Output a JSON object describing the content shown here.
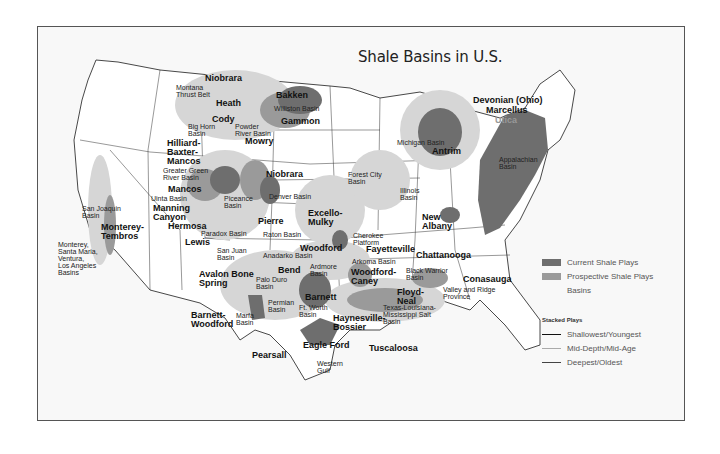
{
  "title": "Shale Basins in U.S.",
  "colors": {
    "current_play": "#6e6e6e",
    "prospective_play": "#9a9a9a",
    "basin": "#d6d6d6",
    "frame_bg": "#f8f8f8",
    "border": "#555555"
  },
  "legend": {
    "items": [
      {
        "label": "Current Shale Plays",
        "swatch": "current"
      },
      {
        "label": "Prospective Shale Plays",
        "swatch": "prospective"
      },
      {
        "label": "Basins",
        "swatch": "basin"
      }
    ],
    "stacked_header": "Stacked Plays",
    "stacked": [
      {
        "label": "Shallowest/Youngest",
        "line": "#111111"
      },
      {
        "label": "Mid-Depth/Mid-Age",
        "line": "#aaaaaa"
      },
      {
        "label": "Deepest/Oldest",
        "line": "#444444"
      }
    ]
  },
  "plays": {
    "niobrara_n": "Niobrara",
    "bakken": "Bakken",
    "heath": "Heath",
    "cody": "Cody",
    "gammon": "Gammon",
    "mowry": "Mowry",
    "hilliard": "Hilliard-\nBaxter-\nMancos",
    "niobrara_c": "Niobrara",
    "mancos": "Mancos",
    "manning": "Manning\nCanyon",
    "hermosa": "Hermosa",
    "lewis": "Lewis",
    "pierre": "Pierre",
    "excello": "Excello-\nMulky",
    "woodford": "Woodford",
    "fayetteville": "Fayetteville",
    "woodford_caney": "Woodford-\nCaney",
    "bend": "Bend",
    "avalon": "Avalon Bone\nSpring",
    "barnett": "Barnett",
    "barnett_woodford": "Barnett-\nWoodford",
    "haynesville": "Haynesville-\nBossier",
    "eagle_ford": "Eagle Ford",
    "pearsall": "Pearsall",
    "tuscaloosa": "Tuscaloosa",
    "floyd": "Floyd-\nNeal",
    "chattanooga": "Chattanooga",
    "conasauga": "Conasauga",
    "new_albany": "New\nAlbany",
    "antrim": "Antrim",
    "devonian": "Devonian (Ohio)",
    "marcellus": "Marcellus",
    "utica": "Utica",
    "monterey": "Monterey-\nTembros"
  },
  "basins": {
    "montana_thrust": "Montana\nThrust Belt",
    "williston": "Williston Basin",
    "big_horn": "Big Horn\nBasin",
    "powder_river": "Powder\nRiver Basin",
    "greater_green": "Greater Green\nRiver Basin",
    "uinta": "Uinta Basin",
    "piceance": "Piceance\nBasin",
    "denver": "Denver Basin",
    "paradox": "Paradox Basin",
    "raton": "Raton Basin",
    "san_juan": "San Juan\nBasin",
    "anadarko": "Anadarko Basin",
    "ardmore": "Ardmore\nBasin",
    "arkoma": "Arkoma Basin",
    "cherokee": "Cherokee\nPlatform",
    "forest_city": "Forest City\nBasin",
    "illinois": "Illinois\nBasin",
    "michigan": "Michigan Basin",
    "appalachian": "Appalachian\nBasin",
    "black_warrior": "Black Warrior\nBasin",
    "valley_ridge": "Valley and Ridge\nProvince",
    "tx_la_ms": "Texas-Louisiana-\nMississippi Salt\nBasin",
    "palo_duro": "Palo Duro\nBasin",
    "permian": "Permian\nBasin",
    "ft_worth": "Ft. Worth\nBasin",
    "marfa": "Marfa\nBasin",
    "western_gulf": "Western\nGulf",
    "san_joaquin": "San Joaquin\nBasin",
    "monterey_basins": "Monterey,\nSanta Maria,\nVentura,\nLos Angeles\nBasins"
  }
}
